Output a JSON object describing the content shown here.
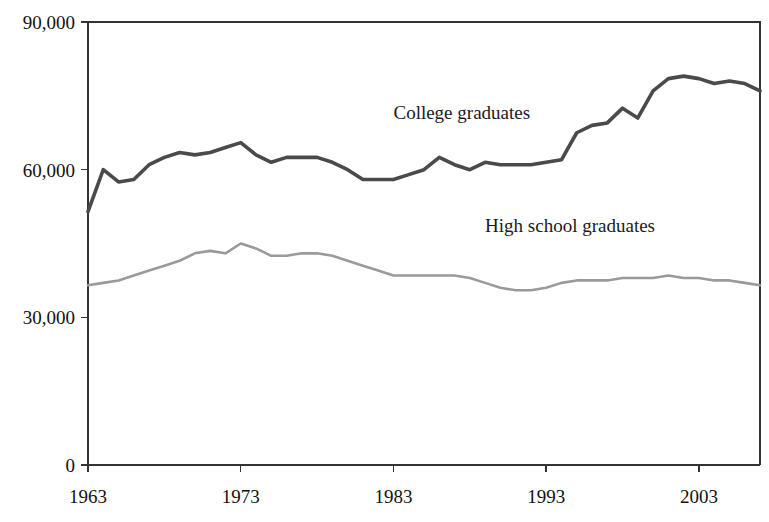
{
  "chart_data": {
    "type": "line",
    "title": "",
    "xlabel": "",
    "ylabel": "",
    "xlim": [
      1963,
      2007
    ],
    "ylim": [
      0,
      90000
    ],
    "grid": false,
    "legend": "inline-labels",
    "y_ticks": [
      "0",
      "30,000",
      "60,000",
      "90,000"
    ],
    "y_tick_values": [
      0,
      30000,
      60000,
      90000
    ],
    "x_ticks": [
      "1963",
      "1973",
      "1983",
      "1993",
      "2003"
    ],
    "x_tick_values": [
      1963,
      1973,
      1983,
      1993,
      2003
    ],
    "x": [
      1963,
      1964,
      1965,
      1966,
      1967,
      1968,
      1969,
      1970,
      1971,
      1972,
      1973,
      1974,
      1975,
      1976,
      1977,
      1978,
      1979,
      1980,
      1981,
      1982,
      1983,
      1984,
      1985,
      1986,
      1987,
      1988,
      1989,
      1990,
      1991,
      1992,
      1993,
      1994,
      1995,
      1996,
      1997,
      1998,
      1999,
      2000,
      2001,
      2002,
      2003,
      2004,
      2005,
      2006,
      2007
    ],
    "series": [
      {
        "name": "College graduates",
        "color": "#4a4a4a",
        "label_x": 1983,
        "label_y": 71500,
        "values": [
          51500,
          60000,
          57500,
          58000,
          61000,
          62500,
          63500,
          63000,
          63500,
          64500,
          65500,
          63000,
          61500,
          62500,
          62500,
          62500,
          61500,
          60000,
          58000,
          58000,
          58000,
          59000,
          60000,
          62500,
          61000,
          60000,
          61500,
          61000,
          61000,
          61000,
          61500,
          62000,
          67500,
          69000,
          69500,
          72500,
          70500,
          76000,
          78500,
          79000,
          78500,
          77500,
          78000,
          77500,
          76000
        ]
      },
      {
        "name": "High school graduates",
        "color": "#9a9a9a",
        "label_x": 1989,
        "label_y": 48500,
        "values": [
          36500,
          37000,
          37500,
          38500,
          39500,
          40500,
          41500,
          43000,
          43500,
          43000,
          45000,
          44000,
          42500,
          42500,
          43000,
          43000,
          42500,
          41500,
          40500,
          39500,
          38500,
          38500,
          38500,
          38500,
          38500,
          38000,
          37000,
          36000,
          35500,
          35500,
          36000,
          37000,
          37500,
          37500,
          37500,
          38000,
          38000,
          38000,
          38500,
          38000,
          38000,
          37500,
          37500,
          37000,
          36500
        ]
      }
    ]
  },
  "axes": {
    "zero_label": "0"
  }
}
